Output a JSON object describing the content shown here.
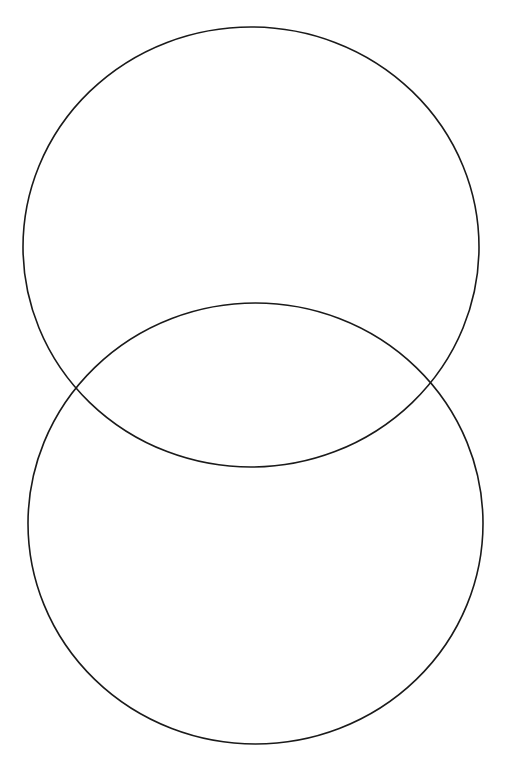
{
  "diagram": {
    "type": "venn",
    "background": "#ffffff",
    "stroke_color": "#1a1a1a",
    "stroke_width": 1.6,
    "sets": [
      {
        "id": "top-circle",
        "cx": 251,
        "cy": 247,
        "rx": 228,
        "ry": 220,
        "label": ""
      },
      {
        "id": "bottom-circle",
        "cx": 255.5,
        "cy": 523.5,
        "rx": 227.5,
        "ry": 220.5,
        "label": ""
      }
    ]
  }
}
